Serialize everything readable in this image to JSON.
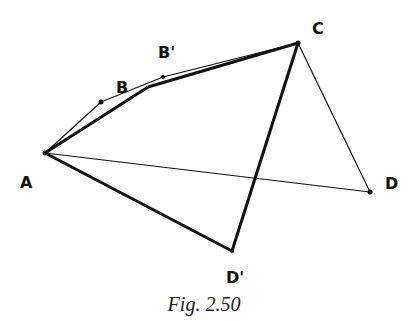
{
  "figure": {
    "caption": "Fig. 2.50",
    "points": {
      "A": {
        "label": "A",
        "x": 45,
        "y": 153
      },
      "P": {
        "label": "",
        "x": 101,
        "y": 102
      },
      "B": {
        "label": "B",
        "x": 148,
        "y": 87
      },
      "Bp": {
        "label": "B'",
        "x": 163,
        "y": 77
      },
      "C": {
        "label": "C",
        "x": 298,
        "y": 43
      },
      "D": {
        "label": "D",
        "x": 370,
        "y": 192
      },
      "Dp": {
        "label": "D'",
        "x": 232,
        "y": 251
      }
    },
    "thick_polygon": [
      "A",
      "B",
      "C",
      "D'"
    ],
    "thin_polygon": [
      "A",
      "P",
      "B'",
      "C",
      "D"
    ],
    "colors": {
      "line": "#111111",
      "background": "#ffffff"
    }
  }
}
